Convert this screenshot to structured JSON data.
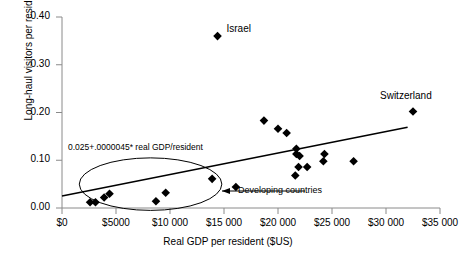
{
  "chart_data": {
    "type": "scatter",
    "title": "",
    "xlabel": "Real GDP per resident ($US)",
    "ylabel": "Long-haul visitors per resident",
    "xlim": [
      0,
      35000
    ],
    "ylim": [
      0.0,
      0.4
    ],
    "grid": false,
    "legend_position": "none",
    "xticks": [
      "$0",
      "$5000",
      "$10 000",
      "$15 000",
      "$20 000",
      "$25 000",
      "$30 000",
      "$35 000"
    ],
    "xtick_values": [
      0,
      5000,
      10000,
      15000,
      20000,
      25000,
      30000,
      35000
    ],
    "yticks": [
      "0.00",
      "0.10",
      "0.20",
      "0.30",
      "0.40"
    ],
    "ytick_values": [
      0.0,
      0.1,
      0.2,
      0.3,
      0.4
    ],
    "points": [
      {
        "x": 2600,
        "y": 0.012
      },
      {
        "x": 3100,
        "y": 0.012
      },
      {
        "x": 3900,
        "y": 0.022
      },
      {
        "x": 4400,
        "y": 0.03
      },
      {
        "x": 8700,
        "y": 0.014
      },
      {
        "x": 9600,
        "y": 0.032
      },
      {
        "x": 13900,
        "y": 0.061
      },
      {
        "x": 14400,
        "y": 0.36
      },
      {
        "x": 16100,
        "y": 0.044
      },
      {
        "x": 18700,
        "y": 0.183
      },
      {
        "x": 20000,
        "y": 0.166
      },
      {
        "x": 20800,
        "y": 0.157
      },
      {
        "x": 21700,
        "y": 0.124
      },
      {
        "x": 21700,
        "y": 0.113
      },
      {
        "x": 22000,
        "y": 0.109
      },
      {
        "x": 21900,
        "y": 0.086
      },
      {
        "x": 22700,
        "y": 0.086
      },
      {
        "x": 21600,
        "y": 0.068
      },
      {
        "x": 24300,
        "y": 0.113
      },
      {
        "x": 24200,
        "y": 0.098
      },
      {
        "x": 27000,
        "y": 0.098
      },
      {
        "x": 32500,
        "y": 0.202
      }
    ],
    "annotations": {
      "israel": {
        "label": "Israel",
        "x": 14400,
        "y": 0.36
      },
      "switzerland": {
        "label": "Switzerland",
        "x": 32500,
        "y": 0.202
      },
      "equation": "0.025+.0000045* real GDP/resident",
      "developing": "Developing countries"
    },
    "trendline": {
      "intercept": 0.025,
      "slope": 4.5e-06,
      "x_start": 0,
      "x_end": 32000,
      "label": "0.025+.0000045* real GDP/resident"
    },
    "ellipse": {
      "label": "Developing countries",
      "center_x": 8200,
      "center_y": 0.05,
      "width_x": 13200,
      "height_y": 0.11
    },
    "colors": {
      "marker": "#000000",
      "axis": "#808080",
      "trendline": "#000000",
      "ellipse": "#000000",
      "background": "#ffffff"
    }
  }
}
